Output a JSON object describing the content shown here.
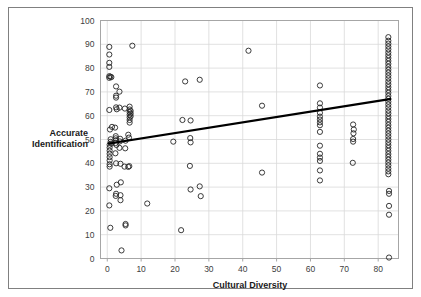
{
  "figure": {
    "frame_color": "#808080",
    "background": "#ffffff"
  },
  "chart_data": {
    "type": "scatter",
    "title": "",
    "xlabel": "Cultural Diversity",
    "ylabel": "Accurate Identification",
    "ylabel_lines": [
      "Accurate",
      "Identification"
    ],
    "xlim": [
      -2,
      86
    ],
    "ylim": [
      0,
      100
    ],
    "xticks": [
      0,
      10,
      20,
      30,
      40,
      50,
      60,
      70,
      80
    ],
    "yticks": [
      0,
      10,
      20,
      30,
      40,
      50,
      60,
      70,
      80,
      90,
      100
    ],
    "xtick_labels": [
      "0",
      "10",
      "20",
      "30",
      "40",
      "50",
      "60",
      "70",
      "80"
    ],
    "ytick_labels": [
      "0",
      "10",
      "20",
      "30",
      "40",
      "50",
      "60",
      "70",
      "80",
      "90",
      "100"
    ],
    "grid": "horizontal-and-vertical",
    "legend": "none",
    "marker": {
      "shape": "open-circle",
      "radius": 2.6,
      "stroke": "#262626"
    },
    "trendline": {
      "present": true,
      "color": "#000000",
      "x_start": 0.5,
      "y_start": 48.3,
      "x_end": 83.5,
      "y_end": 67.0,
      "slope": 0.225,
      "intercept": 48.2
    },
    "points": [
      [
        0.6,
        88.9
      ],
      [
        0.6,
        85.7
      ],
      [
        0.6,
        82.2
      ],
      [
        0.6,
        80.5
      ],
      [
        0.6,
        76.6
      ],
      [
        0.9,
        76.4
      ],
      [
        1.2,
        76.2
      ],
      [
        0.6,
        75.9
      ],
      [
        0.6,
        62.4
      ],
      [
        0.8,
        54.2
      ],
      [
        1.4,
        55.3
      ],
      [
        2.3,
        55.0
      ],
      [
        1.0,
        50.1
      ],
      [
        1.0,
        49.0
      ],
      [
        1.2,
        48.3
      ],
      [
        0.7,
        47.8
      ],
      [
        0.7,
        46.6
      ],
      [
        0.7,
        45.3
      ],
      [
        0.7,
        44.0
      ],
      [
        0.7,
        42.6
      ],
      [
        0.7,
        41.2
      ],
      [
        0.7,
        39.6
      ],
      [
        0.7,
        38.6
      ],
      [
        0.6,
        29.5
      ],
      [
        0.6,
        22.3
      ],
      [
        0.9,
        12.9
      ],
      [
        2.6,
        72.3
      ],
      [
        2.6,
        68.4
      ],
      [
        2.6,
        67.6
      ],
      [
        2.6,
        63.5
      ],
      [
        2.8,
        62.7
      ],
      [
        2.5,
        51.4
      ],
      [
        2.5,
        50.5
      ],
      [
        2.6,
        49.7
      ],
      [
        2.4,
        48.5
      ],
      [
        2.7,
        47.7
      ],
      [
        2.4,
        44.2
      ],
      [
        2.6,
        40.0
      ],
      [
        2.8,
        31.0
      ],
      [
        2.6,
        27.2
      ],
      [
        2.5,
        26.3
      ],
      [
        3.6,
        70.1
      ],
      [
        3.6,
        63.4
      ],
      [
        3.8,
        50.3
      ],
      [
        3.7,
        49.2
      ],
      [
        3.6,
        46.5
      ],
      [
        3.9,
        39.8
      ],
      [
        4.0,
        32.0
      ],
      [
        3.9,
        26.6
      ],
      [
        3.9,
        24.5
      ],
      [
        4.2,
        3.4
      ],
      [
        5.2,
        63.0
      ],
      [
        5.4,
        49.5
      ],
      [
        5.3,
        46.3
      ],
      [
        5.1,
        38.6
      ],
      [
        5.4,
        13.9
      ],
      [
        5.4,
        14.5
      ],
      [
        6.6,
        63.8
      ],
      [
        6.6,
        62.6
      ],
      [
        6.6,
        61.5
      ],
      [
        6.6,
        60.4
      ],
      [
        6.6,
        59.3
      ],
      [
        6.6,
        58.2
      ],
      [
        6.6,
        57.1
      ],
      [
        6.9,
        62.0
      ],
      [
        6.9,
        60.9
      ],
      [
        6.9,
        59.8
      ],
      [
        6.2,
        52.0
      ],
      [
        6.4,
        50.8
      ],
      [
        6.5,
        38.8
      ],
      [
        6.2,
        38.5
      ],
      [
        7.4,
        89.4
      ],
      [
        11.8,
        23.1
      ],
      [
        19.5,
        49.1
      ],
      [
        21.8,
        11.9
      ],
      [
        22.2,
        58.2
      ],
      [
        23.0,
        74.4
      ],
      [
        24.6,
        58.0
      ],
      [
        24.5,
        50.6
      ],
      [
        24.6,
        48.8
      ],
      [
        24.4,
        38.9
      ],
      [
        24.6,
        29.0
      ],
      [
        27.3,
        75.1
      ],
      [
        27.3,
        30.3
      ],
      [
        27.6,
        26.2
      ],
      [
        41.7,
        87.3
      ],
      [
        45.7,
        64.2
      ],
      [
        45.7,
        36.1
      ],
      [
        62.8,
        72.7
      ],
      [
        62.8,
        65.2
      ],
      [
        62.8,
        63.4
      ],
      [
        62.8,
        61.2
      ],
      [
        62.8,
        59.6
      ],
      [
        62.8,
        58.4
      ],
      [
        62.8,
        57.2
      ],
      [
        62.8,
        56.0
      ],
      [
        62.8,
        53.2
      ],
      [
        62.8,
        47.4
      ],
      [
        62.8,
        44.0
      ],
      [
        62.8,
        42.4
      ],
      [
        62.8,
        41.0
      ],
      [
        62.8,
        37.0
      ],
      [
        62.8,
        32.8
      ],
      [
        72.6,
        56.3
      ],
      [
        72.8,
        54.2
      ],
      [
        72.7,
        52.6
      ],
      [
        72.6,
        50.2
      ],
      [
        72.6,
        49.1
      ],
      [
        72.5,
        40.2
      ],
      [
        83.0,
        93.0
      ],
      [
        83.0,
        91.5
      ],
      [
        83.0,
        90.3
      ],
      [
        83.0,
        89.1
      ],
      [
        83.0,
        87.9
      ],
      [
        83.0,
        86.6
      ],
      [
        83.0,
        85.4
      ],
      [
        83.0,
        84.2
      ],
      [
        83.0,
        83.0
      ],
      [
        83.0,
        81.8
      ],
      [
        83.0,
        80.5
      ],
      [
        83.0,
        79.3
      ],
      [
        83.0,
        78.1
      ],
      [
        83.0,
        76.9
      ],
      [
        83.0,
        75.7
      ],
      [
        83.0,
        74.4
      ],
      [
        83.0,
        73.2
      ],
      [
        83.0,
        72.0
      ],
      [
        83.0,
        70.8
      ],
      [
        83.0,
        69.6
      ],
      [
        83.0,
        68.3
      ],
      [
        83.0,
        67.1
      ],
      [
        83.0,
        65.9
      ],
      [
        83.0,
        64.7
      ],
      [
        83.0,
        63.5
      ],
      [
        83.0,
        62.2
      ],
      [
        83.0,
        61.0
      ],
      [
        83.0,
        59.8
      ],
      [
        83.0,
        58.6
      ],
      [
        83.0,
        57.4
      ],
      [
        83.0,
        56.1
      ],
      [
        83.0,
        54.9
      ],
      [
        83.0,
        53.7
      ],
      [
        83.0,
        52.5
      ],
      [
        83.0,
        51.3
      ],
      [
        83.0,
        50.0
      ],
      [
        83.0,
        48.8
      ],
      [
        83.0,
        47.6
      ],
      [
        83.0,
        46.4
      ],
      [
        83.0,
        45.2
      ],
      [
        83.0,
        43.9
      ],
      [
        83.0,
        42.7
      ],
      [
        83.0,
        41.5
      ],
      [
        83.0,
        40.3
      ],
      [
        83.0,
        39.1
      ],
      [
        83.0,
        37.8
      ],
      [
        83.0,
        36.6
      ],
      [
        83.0,
        35.4
      ],
      [
        83.2,
        28.4
      ],
      [
        83.2,
        27.2
      ],
      [
        83.2,
        22.1
      ],
      [
        83.2,
        18.4
      ],
      [
        83.2,
        0.4
      ]
    ]
  }
}
